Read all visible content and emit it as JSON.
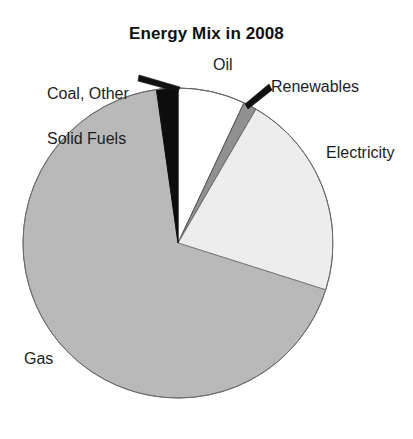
{
  "chart_data": {
    "type": "pie",
    "title": "Energy Mix in 2008",
    "xlabel": "",
    "ylabel": "",
    "legend_position": "none",
    "grid": false,
    "labels_placement": "outside-with-leader-lines",
    "start_angle_deg": 0,
    "direction": "clockwise",
    "categories": [
      "Oil",
      "Renewables",
      "Electricity",
      "Gas",
      "Coal, Other Solid Fuels"
    ],
    "values": [
      7.0,
      1.4,
      21.5,
      67.9,
      2.2
    ],
    "slices": [
      {
        "label": "Oil",
        "value": 7.0,
        "start_deg": 0.0,
        "end_deg": 25.2,
        "fill": "#ffffff",
        "stroke": "#555555"
      },
      {
        "label": "Renewables",
        "value": 1.4,
        "start_deg": 25.2,
        "end_deg": 30.2,
        "fill": "#8c8c8c",
        "stroke": "#444444"
      },
      {
        "label": "Electricity",
        "value": 21.5,
        "start_deg": 30.2,
        "end_deg": 107.6,
        "fill": "#f0f0f0",
        "stroke": "#666666"
      },
      {
        "label": "Gas",
        "value": 67.9,
        "start_deg": 107.6,
        "end_deg": 352.0,
        "fill": "#b8b8b8",
        "stroke": "#777777"
      },
      {
        "label": "Coal, Other Solid Fuels",
        "value": 2.2,
        "start_deg": 352.0,
        "end_deg": 360.0,
        "fill": "#0d0d0d",
        "stroke": "#0d0d0d"
      }
    ]
  },
  "title": {
    "text": "Energy Mix in 2008"
  },
  "labels": {
    "coal_line1": "Coal, Other",
    "coal_line2": "Solid Fuels",
    "oil": "Oil",
    "renewables": "Renewables",
    "electricity": "Electricity",
    "gas": "Gas"
  },
  "colors": {
    "background": "#ffffff",
    "text": "#1d1d1d",
    "title": "#111111",
    "oil": "#ffffff",
    "renewables": "#8c8c8c",
    "electricity": "#f0f0f0",
    "gas": "#b8b8b8",
    "coal": "#0d0d0d",
    "leader_line": "#111111",
    "outline": "#6a6a6a"
  },
  "geometry": {
    "center_x": 178,
    "center_y": 243,
    "radius": 155
  }
}
